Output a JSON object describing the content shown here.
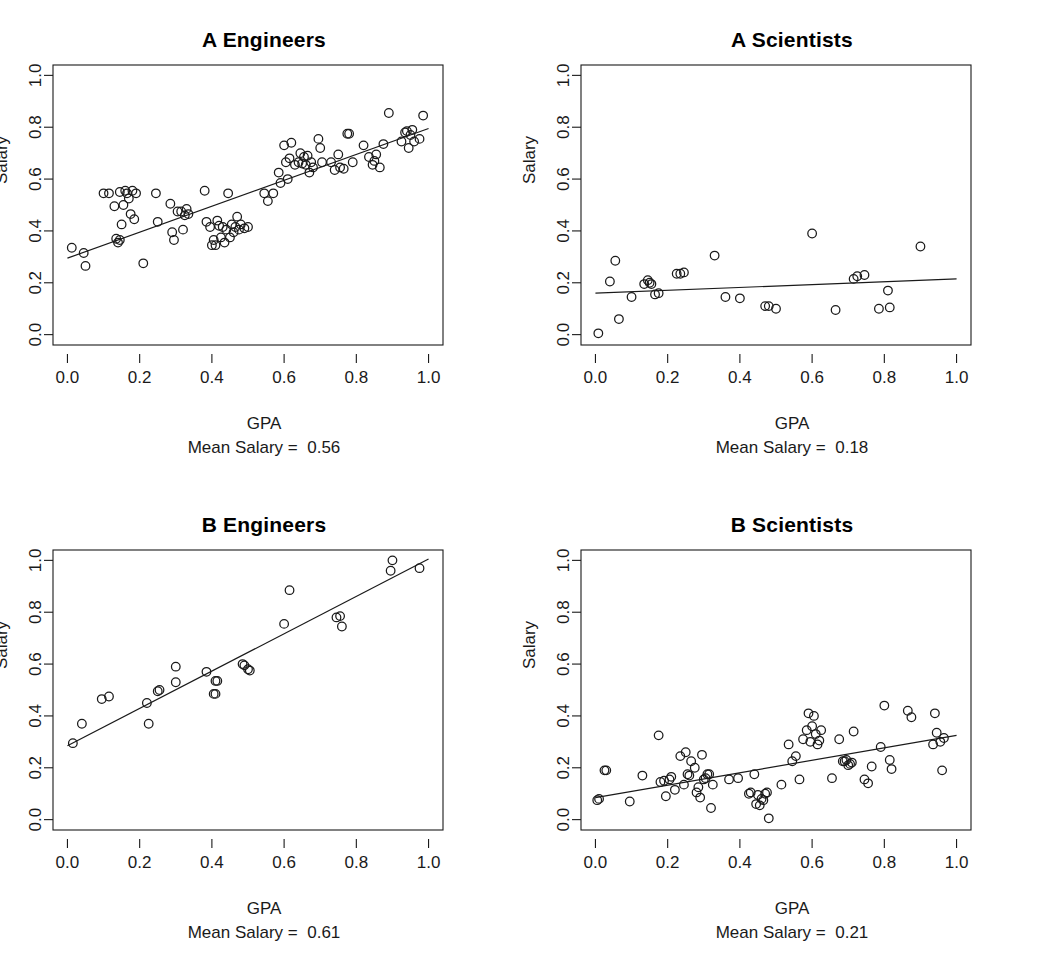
{
  "figure": {
    "width": 1056,
    "height": 969,
    "background": "#ffffff",
    "ink_color": "#1a1a1a",
    "marker": "open-circle",
    "marker_radius_px": 4.3
  },
  "chart_data": [
    {
      "type": "scatter",
      "panel_id": "a-engineers",
      "title": "A Engineers",
      "xlabel": "GPA",
      "ylabel": "Salary",
      "caption": "Mean Salary =  0.56",
      "mean_salary": 0.56,
      "xlim": [
        -0.04,
        1.04
      ],
      "ylim": [
        -0.04,
        1.04
      ],
      "xticks": [
        0.0,
        0.2,
        0.4,
        0.6,
        0.8,
        1.0
      ],
      "yticks": [
        0.0,
        0.2,
        0.4,
        0.6,
        0.8,
        1.0
      ],
      "xtick_labels": [
        "0.0",
        "0.2",
        "0.4",
        "0.6",
        "0.8",
        "1.0"
      ],
      "ytick_labels": [
        "0.0",
        "0.2",
        "0.4",
        "0.6",
        "0.8",
        "1.0"
      ],
      "grid": false,
      "legend": null,
      "fit_line": {
        "x0": 0.0,
        "y0": 0.295,
        "x1": 1.0,
        "y1": 0.795
      },
      "x": [
        0.012,
        0.045,
        0.05,
        0.1,
        0.115,
        0.13,
        0.135,
        0.14,
        0.145,
        0.145,
        0.15,
        0.155,
        0.16,
        0.165,
        0.17,
        0.175,
        0.18,
        0.185,
        0.19,
        0.21,
        0.245,
        0.25,
        0.285,
        0.29,
        0.295,
        0.305,
        0.315,
        0.32,
        0.325,
        0.33,
        0.335,
        0.38,
        0.385,
        0.395,
        0.4,
        0.405,
        0.41,
        0.415,
        0.42,
        0.425,
        0.43,
        0.435,
        0.44,
        0.445,
        0.45,
        0.455,
        0.46,
        0.465,
        0.47,
        0.475,
        0.48,
        0.49,
        0.5,
        0.545,
        0.555,
        0.57,
        0.585,
        0.59,
        0.6,
        0.605,
        0.61,
        0.615,
        0.62,
        0.63,
        0.64,
        0.645,
        0.65,
        0.655,
        0.66,
        0.665,
        0.67,
        0.675,
        0.68,
        0.695,
        0.7,
        0.705,
        0.73,
        0.74,
        0.75,
        0.755,
        0.765,
        0.775,
        0.78,
        0.79,
        0.82,
        0.835,
        0.845,
        0.85,
        0.855,
        0.865,
        0.875,
        0.89,
        0.925,
        0.935,
        0.94,
        0.945,
        0.95,
        0.955,
        0.96,
        0.975,
        0.985
      ],
      "y": [
        0.335,
        0.315,
        0.265,
        0.545,
        0.545,
        0.495,
        0.37,
        0.355,
        0.365,
        0.55,
        0.425,
        0.5,
        0.555,
        0.545,
        0.525,
        0.465,
        0.555,
        0.445,
        0.545,
        0.275,
        0.545,
        0.435,
        0.505,
        0.395,
        0.365,
        0.475,
        0.475,
        0.405,
        0.46,
        0.485,
        0.465,
        0.555,
        0.435,
        0.415,
        0.345,
        0.365,
        0.345,
        0.44,
        0.42,
        0.375,
        0.415,
        0.355,
        0.405,
        0.545,
        0.375,
        0.425,
        0.395,
        0.415,
        0.455,
        0.405,
        0.425,
        0.41,
        0.415,
        0.545,
        0.515,
        0.545,
        0.625,
        0.585,
        0.73,
        0.665,
        0.6,
        0.68,
        0.74,
        0.655,
        0.665,
        0.7,
        0.66,
        0.685,
        0.655,
        0.69,
        0.625,
        0.665,
        0.645,
        0.755,
        0.72,
        0.665,
        0.665,
        0.635,
        0.695,
        0.645,
        0.64,
        0.775,
        0.775,
        0.665,
        0.73,
        0.685,
        0.655,
        0.67,
        0.695,
        0.645,
        0.735,
        0.855,
        0.745,
        0.78,
        0.785,
        0.72,
        0.77,
        0.79,
        0.745,
        0.755,
        0.845
      ]
    },
    {
      "type": "scatter",
      "panel_id": "a-scientists",
      "title": "A Scientists",
      "xlabel": "GPA",
      "ylabel": "Salary",
      "caption": "Mean Salary =  0.18",
      "mean_salary": 0.18,
      "xlim": [
        -0.04,
        1.04
      ],
      "ylim": [
        -0.04,
        1.04
      ],
      "xticks": [
        0.0,
        0.2,
        0.4,
        0.6,
        0.8,
        1.0
      ],
      "yticks": [
        0.0,
        0.2,
        0.4,
        0.6,
        0.8,
        1.0
      ],
      "xtick_labels": [
        "0.0",
        "0.2",
        "0.4",
        "0.6",
        "0.8",
        "1.0"
      ],
      "ytick_labels": [
        "0.0",
        "0.2",
        "0.4",
        "0.6",
        "0.8",
        "1.0"
      ],
      "grid": false,
      "legend": null,
      "fit_line": {
        "x0": 0.0,
        "y0": 0.16,
        "x1": 1.0,
        "y1": 0.215
      },
      "x": [
        0.008,
        0.04,
        0.055,
        0.065,
        0.1,
        0.135,
        0.145,
        0.15,
        0.155,
        0.165,
        0.175,
        0.225,
        0.235,
        0.245,
        0.33,
        0.36,
        0.4,
        0.47,
        0.48,
        0.5,
        0.6,
        0.665,
        0.715,
        0.725,
        0.745,
        0.785,
        0.81,
        0.815,
        0.9
      ],
      "y": [
        0.005,
        0.205,
        0.285,
        0.06,
        0.145,
        0.195,
        0.21,
        0.2,
        0.195,
        0.155,
        0.16,
        0.235,
        0.235,
        0.24,
        0.305,
        0.145,
        0.14,
        0.11,
        0.11,
        0.1,
        0.39,
        0.095,
        0.215,
        0.225,
        0.23,
        0.1,
        0.17,
        0.105,
        0.34
      ]
    },
    {
      "type": "scatter",
      "panel_id": "b-engineers",
      "title": "B Engineers",
      "xlabel": "GPA",
      "ylabel": "Salary",
      "caption": "Mean Salary =  0.61",
      "mean_salary": 0.61,
      "xlim": [
        -0.04,
        1.04
      ],
      "ylim": [
        -0.04,
        1.04
      ],
      "xticks": [
        0.0,
        0.2,
        0.4,
        0.6,
        0.8,
        1.0
      ],
      "yticks": [
        0.0,
        0.2,
        0.4,
        0.6,
        0.8,
        1.0
      ],
      "xtick_labels": [
        "0.0",
        "0.2",
        "0.4",
        "0.6",
        "0.8",
        "1.0"
      ],
      "ytick_labels": [
        "0.0",
        "0.2",
        "0.4",
        "0.6",
        "0.8",
        "1.0"
      ],
      "grid": false,
      "legend": null,
      "fit_line": {
        "x0": 0.0,
        "y0": 0.285,
        "x1": 1.0,
        "y1": 1.005
      },
      "x": [
        0.015,
        0.04,
        0.095,
        0.115,
        0.22,
        0.225,
        0.25,
        0.255,
        0.3,
        0.3,
        0.385,
        0.405,
        0.41,
        0.41,
        0.415,
        0.485,
        0.49,
        0.5,
        0.505,
        0.6,
        0.615,
        0.745,
        0.755,
        0.76,
        0.895,
        0.9,
        0.975
      ],
      "y": [
        0.295,
        0.37,
        0.465,
        0.475,
        0.45,
        0.37,
        0.495,
        0.5,
        0.53,
        0.59,
        0.57,
        0.485,
        0.535,
        0.485,
        0.535,
        0.6,
        0.595,
        0.58,
        0.575,
        0.755,
        0.885,
        0.78,
        0.785,
        0.745,
        0.96,
        1.0,
        0.97
      ]
    },
    {
      "type": "scatter",
      "panel_id": "b-scientists",
      "title": "B Scientists",
      "xlabel": "GPA",
      "ylabel": "Salary",
      "caption": "Mean Salary =  0.21",
      "mean_salary": 0.21,
      "xlim": [
        -0.04,
        1.04
      ],
      "ylim": [
        -0.04,
        1.04
      ],
      "xticks": [
        0.0,
        0.2,
        0.4,
        0.6,
        0.8,
        1.0
      ],
      "yticks": [
        0.0,
        0.2,
        0.4,
        0.6,
        0.8,
        1.0
      ],
      "xtick_labels": [
        "0.0",
        "0.2",
        "0.4",
        "0.6",
        "0.8",
        "1.0"
      ],
      "ytick_labels": [
        "0.0",
        "0.2",
        "0.4",
        "0.6",
        "0.8",
        "1.0"
      ],
      "grid": false,
      "legend": null,
      "fit_line": {
        "x0": 0.0,
        "y0": 0.085,
        "x1": 1.0,
        "y1": 0.325
      },
      "x": [
        0.005,
        0.01,
        0.025,
        0.03,
        0.095,
        0.13,
        0.175,
        0.18,
        0.19,
        0.195,
        0.205,
        0.21,
        0.22,
        0.235,
        0.245,
        0.25,
        0.255,
        0.26,
        0.265,
        0.275,
        0.28,
        0.285,
        0.29,
        0.295,
        0.3,
        0.305,
        0.31,
        0.315,
        0.32,
        0.325,
        0.37,
        0.395,
        0.425,
        0.43,
        0.44,
        0.445,
        0.45,
        0.455,
        0.46,
        0.465,
        0.47,
        0.475,
        0.48,
        0.515,
        0.535,
        0.545,
        0.555,
        0.565,
        0.575,
        0.585,
        0.59,
        0.595,
        0.6,
        0.605,
        0.61,
        0.615,
        0.62,
        0.625,
        0.655,
        0.675,
        0.685,
        0.69,
        0.695,
        0.7,
        0.705,
        0.71,
        0.715,
        0.745,
        0.755,
        0.765,
        0.79,
        0.8,
        0.815,
        0.82,
        0.865,
        0.875,
        0.935,
        0.94,
        0.945,
        0.955,
        0.96,
        0.965
      ],
      "y": [
        0.075,
        0.08,
        0.19,
        0.19,
        0.07,
        0.17,
        0.325,
        0.145,
        0.15,
        0.09,
        0.155,
        0.165,
        0.115,
        0.245,
        0.135,
        0.26,
        0.175,
        0.17,
        0.225,
        0.2,
        0.105,
        0.125,
        0.085,
        0.25,
        0.155,
        0.16,
        0.175,
        0.175,
        0.045,
        0.135,
        0.155,
        0.16,
        0.1,
        0.105,
        0.175,
        0.06,
        0.095,
        0.055,
        0.08,
        0.075,
        0.1,
        0.105,
        0.005,
        0.135,
        0.29,
        0.225,
        0.245,
        0.155,
        0.31,
        0.345,
        0.41,
        0.3,
        0.36,
        0.4,
        0.33,
        0.29,
        0.305,
        0.345,
        0.16,
        0.31,
        0.225,
        0.225,
        0.23,
        0.21,
        0.215,
        0.22,
        0.34,
        0.155,
        0.14,
        0.205,
        0.28,
        0.44,
        0.23,
        0.195,
        0.42,
        0.395,
        0.29,
        0.41,
        0.335,
        0.3,
        0.19,
        0.315
      ]
    }
  ]
}
